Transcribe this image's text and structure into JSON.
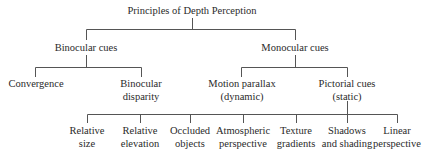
{
  "diagram": {
    "root": "Principles of Depth Perception",
    "level1": [
      "Binocular cues",
      "Monocular cues"
    ],
    "binocular_children": [
      {
        "line1": "Convergence",
        "line2": ""
      },
      {
        "line1": "Binocular",
        "line2": "disparity"
      }
    ],
    "monocular_children": [
      {
        "line1": "Motion parallax",
        "line2": "(dynamic)"
      },
      {
        "line1": "Pictorial cues",
        "line2": "(static)"
      }
    ],
    "pictorial_children": [
      {
        "line1": "Relative",
        "line2": "size"
      },
      {
        "line1": "Relative",
        "line2": "elevation"
      },
      {
        "line1": "Occluded",
        "line2": "objects"
      },
      {
        "line1": "Atmospheric",
        "line2": "perspective"
      },
      {
        "line1": "Texture",
        "line2": "gradients"
      },
      {
        "line1": "Shadows",
        "line2": "and shading"
      },
      {
        "line1": "Linear",
        "line2": "perspective"
      }
    ],
    "line_color": "#555555"
  }
}
